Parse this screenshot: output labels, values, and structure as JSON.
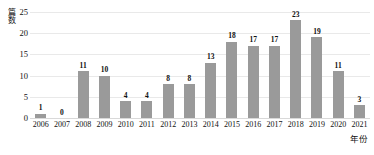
{
  "chart_data": {
    "type": "bar",
    "title": "",
    "subtitle": "",
    "xlabel": "年份",
    "ylabel": "篇数",
    "categories": [
      "2006",
      "2007",
      "2008",
      "2009",
      "2010",
      "2011",
      "2012",
      "2013",
      "2014",
      "2015",
      "2016",
      "2017",
      "2018",
      "2019",
      "2020",
      "2021"
    ],
    "values": [
      1,
      0,
      11,
      10,
      4,
      4,
      8,
      8,
      13,
      18,
      17,
      17,
      23,
      19,
      11,
      3
    ],
    "value_labels": [
      "1",
      "0",
      "11",
      "10",
      "4",
      "4",
      "8",
      "8",
      "13",
      "18",
      "17",
      "17",
      "23",
      "19",
      "11",
      "3"
    ],
    "ylim": [
      0,
      25
    ],
    "yticks": [
      0,
      5,
      10,
      15,
      20,
      25
    ],
    "ytick_labels": [
      "0",
      "5",
      "10",
      "15",
      "20",
      "25"
    ],
    "grid": true,
    "grid_axis": "y",
    "legend": false,
    "legend_position": "none",
    "bar_color": "#9a9a9a",
    "grid_color": "#e9e9e9",
    "text_color": "#111111",
    "background_color": "#ffffff",
    "show_value_labels": true
  }
}
